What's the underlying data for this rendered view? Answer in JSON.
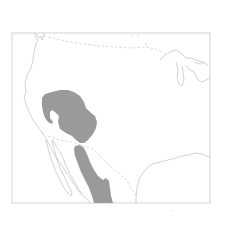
{
  "map": {
    "type": "species-range-map",
    "region": "Western United States and northern Mexico",
    "colors": {
      "background": "#ffffff",
      "range_fill": "#9a9a9a",
      "coastline": "#b4b4b4",
      "border": "#bdbdbd",
      "frame": "#c8c8c8"
    },
    "layers": [
      {
        "name": "frame",
        "description": "rectangular map frame"
      },
      {
        "name": "coastline",
        "description": "Pacific coast, Baja California, Gulf of Mexico, Great Lakes"
      },
      {
        "name": "international-borders",
        "description": "dashed US-Canada and US-Mexico borders"
      },
      {
        "name": "range-north",
        "description": "shaded range covering Great Basin / Utah / Arizona region"
      },
      {
        "name": "range-south",
        "description": "shaded range along Sierra Madre Occidental in Mexico"
      }
    ]
  }
}
